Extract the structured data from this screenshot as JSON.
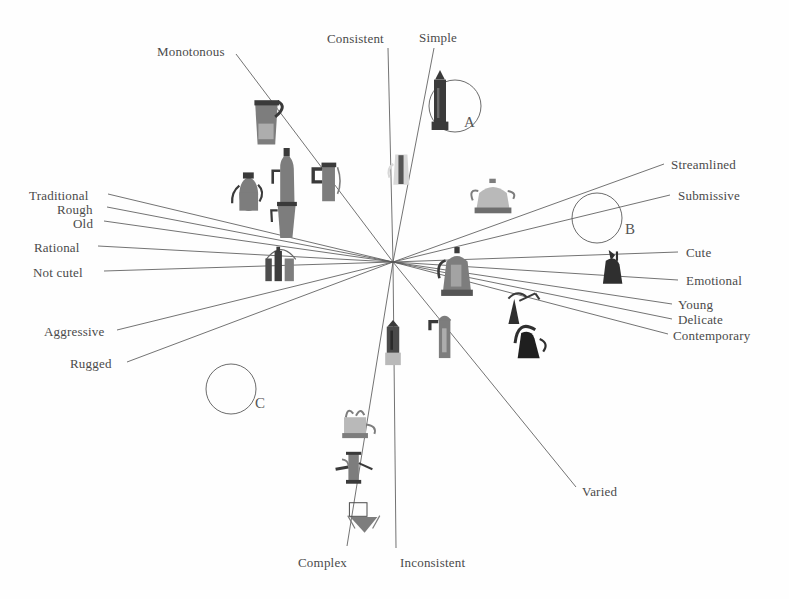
{
  "figure": {
    "type": "radial-semantic-differential",
    "origin": {
      "x": 393,
      "y": 262
    },
    "background_color": "#fefefe",
    "line_color": "#5a5a5a",
    "text_color": "#4a4a4a"
  },
  "axis_labels": [
    {
      "id": "monotonous",
      "text": "Monotonous",
      "x": 157,
      "y": 45,
      "align": "left",
      "line_from": {
        "x": 236,
        "y": 54
      },
      "line_to": {
        "x": 393,
        "y": 262
      }
    },
    {
      "id": "consistent",
      "text": "Consistent",
      "x": 327,
      "y": 32,
      "align": "left",
      "line_from": {
        "x": 388,
        "y": 48
      },
      "line_to": {
        "x": 393,
        "y": 262
      }
    },
    {
      "id": "simple",
      "text": "Simple",
      "x": 419,
      "y": 31,
      "align": "left",
      "line_from": {
        "x": 434,
        "y": 48
      },
      "line_to": {
        "x": 393,
        "y": 262
      }
    },
    {
      "id": "streamlined",
      "text": "Streamlined",
      "x": 671,
      "y": 158,
      "align": "left",
      "line_from": {
        "x": 664,
        "y": 164
      },
      "line_to": {
        "x": 393,
        "y": 262
      }
    },
    {
      "id": "submissive",
      "text": "Submissive",
      "x": 678,
      "y": 189,
      "align": "left",
      "line_from": {
        "x": 670,
        "y": 195
      },
      "line_to": {
        "x": 393,
        "y": 262
      }
    },
    {
      "id": "cute",
      "text": "Cute",
      "x": 686,
      "y": 246,
      "align": "left",
      "line_from": {
        "x": 678,
        "y": 252
      },
      "line_to": {
        "x": 393,
        "y": 262
      }
    },
    {
      "id": "emotional",
      "text": "Emotional",
      "x": 686,
      "y": 274,
      "align": "left",
      "line_from": {
        "x": 678,
        "y": 280
      },
      "line_to": {
        "x": 393,
        "y": 262
      }
    },
    {
      "id": "young",
      "text": "Young",
      "x": 678,
      "y": 298,
      "align": "left",
      "line_from": {
        "x": 672,
        "y": 304
      },
      "line_to": {
        "x": 393,
        "y": 262
      }
    },
    {
      "id": "delicate",
      "text": "Delicate",
      "x": 678,
      "y": 313,
      "align": "left",
      "line_from": {
        "x": 672,
        "y": 319
      },
      "line_to": {
        "x": 393,
        "y": 262
      }
    },
    {
      "id": "contemporary",
      "text": "Contemporary",
      "x": 673,
      "y": 329,
      "align": "left",
      "line_from": {
        "x": 668,
        "y": 334
      },
      "line_to": {
        "x": 393,
        "y": 262
      }
    },
    {
      "id": "varied",
      "text": "Varied",
      "x": 582,
      "y": 485,
      "align": "left",
      "line_from": {
        "x": 576,
        "y": 487
      },
      "line_to": {
        "x": 393,
        "y": 262
      }
    },
    {
      "id": "inconsistent",
      "text": "Inconsistent",
      "x": 400,
      "y": 556,
      "align": "left",
      "line_from": {
        "x": 396,
        "y": 548
      },
      "line_to": {
        "x": 393,
        "y": 262
      }
    },
    {
      "id": "complex",
      "text": "Complex",
      "x": 298,
      "y": 556,
      "align": "left",
      "line_from": {
        "x": 347,
        "y": 546
      },
      "line_to": {
        "x": 393,
        "y": 262
      }
    },
    {
      "id": "rugged",
      "text": "Rugged",
      "x": 70,
      "y": 357,
      "align": "left",
      "line_from": {
        "x": 127,
        "y": 362
      },
      "line_to": {
        "x": 393,
        "y": 262
      }
    },
    {
      "id": "aggressive",
      "text": "Aggressive",
      "x": 44,
      "y": 325,
      "align": "left",
      "line_from": {
        "x": 117,
        "y": 330
      },
      "line_to": {
        "x": 393,
        "y": 262
      }
    },
    {
      "id": "not-cute",
      "text": "Not cutel",
      "x": 33,
      "y": 266,
      "align": "left",
      "line_from": {
        "x": 104,
        "y": 271
      },
      "line_to": {
        "x": 393,
        "y": 262
      }
    },
    {
      "id": "rational",
      "text": "Rational",
      "x": 34,
      "y": 241,
      "align": "left",
      "line_from": {
        "x": 98,
        "y": 246
      },
      "line_to": {
        "x": 393,
        "y": 262
      }
    },
    {
      "id": "old",
      "text": "Old",
      "x": 73,
      "y": 217,
      "align": "left",
      "line_from": {
        "x": 104,
        "y": 221
      },
      "line_to": {
        "x": 393,
        "y": 262
      }
    },
    {
      "id": "rough",
      "text": "Rough",
      "x": 57,
      "y": 203,
      "align": "left",
      "line_from": {
        "x": 107,
        "y": 207
      },
      "line_to": {
        "x": 393,
        "y": 262
      }
    },
    {
      "id": "traditional",
      "text": "Traditional",
      "x": 29,
      "y": 189,
      "align": "left",
      "line_from": {
        "x": 108,
        "y": 194
      },
      "line_to": {
        "x": 393,
        "y": 262
      }
    }
  ],
  "cluster_circles": [
    {
      "id": "A",
      "label": "A",
      "cx": 455,
      "cy": 106,
      "r": 26,
      "label_x": 464,
      "label_y": 115
    },
    {
      "id": "B",
      "label": "B",
      "cx": 597,
      "cy": 218,
      "r": 25,
      "label_x": 625,
      "label_y": 222
    },
    {
      "id": "C",
      "label": "C",
      "cx": 231,
      "cy": 389,
      "r": 25,
      "label_x": 255,
      "label_y": 396
    }
  ],
  "products": [
    {
      "id": "p1",
      "kind": "tall-jug-pot",
      "x": 248,
      "y": 95,
      "w": 40,
      "h": 52
    },
    {
      "id": "p2",
      "kind": "bottle-pot",
      "x": 270,
      "y": 148,
      "w": 34,
      "h": 54
    },
    {
      "id": "p3",
      "kind": "spouted-kettle",
      "x": 230,
      "y": 168,
      "w": 36,
      "h": 44
    },
    {
      "id": "p4",
      "kind": "tapered-jug",
      "x": 270,
      "y": 196,
      "w": 32,
      "h": 42
    },
    {
      "id": "p5",
      "kind": "flat-handle-mug",
      "x": 310,
      "y": 158,
      "w": 32,
      "h": 46
    },
    {
      "id": "p6",
      "kind": "moka-tower",
      "x": 425,
      "y": 70,
      "w": 30,
      "h": 60
    },
    {
      "id": "p7",
      "kind": "cone-pot-pale",
      "x": 385,
      "y": 148,
      "w": 32,
      "h": 40
    },
    {
      "id": "p8",
      "kind": "lidded-teapot",
      "x": 470,
      "y": 178,
      "w": 46,
      "h": 36
    },
    {
      "id": "p9",
      "kind": "dome-group",
      "x": 258,
      "y": 240,
      "w": 46,
      "h": 42
    },
    {
      "id": "p10",
      "kind": "classic-percolator",
      "x": 435,
      "y": 246,
      "w": 44,
      "h": 52
    },
    {
      "id": "p11",
      "kind": "bird-spout-jug",
      "x": 595,
      "y": 250,
      "w": 36,
      "h": 36
    },
    {
      "id": "p12",
      "kind": "wire-figure-pot",
      "x": 500,
      "y": 288,
      "w": 42,
      "h": 38
    },
    {
      "id": "p13",
      "kind": "arch-handle-pot",
      "x": 508,
      "y": 318,
      "w": 44,
      "h": 42
    },
    {
      "id": "p14",
      "kind": "short-moka",
      "x": 380,
      "y": 320,
      "w": 26,
      "h": 48
    },
    {
      "id": "p15",
      "kind": "angular-pot",
      "x": 428,
      "y": 312,
      "w": 32,
      "h": 48
    },
    {
      "id": "p16",
      "kind": "multi-part-rig",
      "x": 333,
      "y": 405,
      "w": 46,
      "h": 36
    },
    {
      "id": "p17",
      "kind": "syringe-press",
      "x": 334,
      "y": 448,
      "w": 40,
      "h": 38
    },
    {
      "id": "p18",
      "kind": "box-funnel",
      "x": 343,
      "y": 500,
      "w": 40,
      "h": 34
    }
  ]
}
